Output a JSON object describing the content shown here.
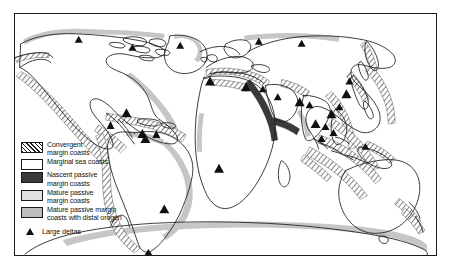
{
  "figure": {
    "frame_border_color": "#1a1a1a",
    "background_color": "#ffffff"
  },
  "legend": {
    "items": [
      {
        "id": "convergent",
        "label": "Convergent\nmargin coasts",
        "swatch": "diagonal-hatch",
        "color": "#ffffff",
        "hatch_color": "#1a1a1a"
      },
      {
        "id": "marginal-sea",
        "label": "Marginal sea coasts",
        "swatch": "solid",
        "color": "#ffffff"
      },
      {
        "id": "nascent-passive",
        "label": "Nascent passive\nmargin coasts",
        "swatch": "solid",
        "color": "#3a3a3a"
      },
      {
        "id": "mature-passive",
        "label": "Mature passive\nmargin coasts",
        "swatch": "solid",
        "color": "#e2e2e2"
      },
      {
        "id": "mature-passive-orogen",
        "label": "Mature passive margin\ncoasts with distal orogen",
        "swatch": "solid",
        "color": "#bdbdbd"
      }
    ],
    "point_symbol": {
      "id": "large-deltas",
      "label": "Large deltas",
      "marker": "filled-triangle",
      "color": "#101010"
    }
  },
  "map": {
    "projection": "cylindrical",
    "coastline_color": "#1a1a1a",
    "landmasses": [
      "North America",
      "South America",
      "Greenland",
      "Europe",
      "Africa",
      "Asia",
      "Australia",
      "New Zealand",
      "Antarctica",
      "Indonesia",
      "Japan",
      "British Isles",
      "Madagascar",
      "Caribbean"
    ],
    "margin_class_examples": {
      "convergent": [
        "western North America",
        "western South America",
        "Caribbean",
        "Mediterranean",
        "East Asia",
        "Japan",
        "Indonesia",
        "New Zealand",
        "Aleutians",
        "Philippines"
      ],
      "nascent_passive": [
        "Red Sea",
        "Gulf of Aden"
      ],
      "mature_passive_with_distal_orogen": [
        "eastern North America",
        "eastern South America",
        "Antarctica",
        "western Africa",
        "Arctic Canada"
      ],
      "mature_passive": [
        "Australia",
        "western Africa",
        "India"
      ]
    },
    "delta_count": 28
  }
}
